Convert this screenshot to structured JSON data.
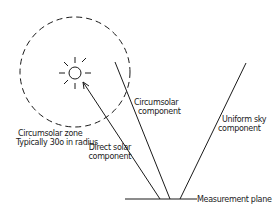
{
  "diagram": {
    "labels": {
      "zone_line1": "Circumsolar zone",
      "zone_line2": "Typically 30o in radius",
      "circumsolar_line1": "Circumsolar",
      "circumsolar_line2": "component",
      "direct_line1": "Direct solar",
      "direct_line2": "component",
      "uniform_line1": "Uniform sky",
      "uniform_line2": "component",
      "plane": "Measurement plane"
    },
    "nodes": [
      {
        "id": "sun",
        "label": "Sun"
      },
      {
        "id": "circumsolar-zone",
        "label": "Circumsolar zone Typically 30o in radius"
      },
      {
        "id": "measurement-plane",
        "label": "Measurement plane"
      }
    ],
    "edges": [
      {
        "from": "sun",
        "to": "measurement-plane",
        "label": "Direct solar component"
      },
      {
        "from": "circumsolar-zone",
        "to": "measurement-plane",
        "label": "Circumsolar component"
      },
      {
        "from": "sky",
        "to": "measurement-plane",
        "label": "Uniform sky component"
      }
    ],
    "colors": {
      "stroke": "#1a1a1a",
      "background": "#ffffff"
    }
  }
}
